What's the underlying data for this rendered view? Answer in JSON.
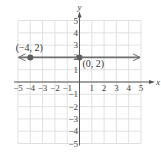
{
  "chart_data": {
    "type": "line",
    "title": "",
    "xlabel": "x",
    "ylabel": "y",
    "xlim": [
      -5,
      5
    ],
    "ylim": [
      -5,
      5
    ],
    "grid": true,
    "x_ticks": [
      -5,
      -4,
      -3,
      -2,
      -1,
      1,
      2,
      3,
      4,
      5
    ],
    "y_ticks": [
      5,
      4,
      3,
      2,
      1,
      -1,
      -2,
      -3,
      -4,
      -5
    ],
    "x_tick_labels": [
      "−5",
      "−4",
      "−3",
      "−2",
      "−1",
      "1",
      "2",
      "3",
      "4",
      "5"
    ],
    "y_tick_labels": [
      "5",
      "4",
      "3",
      "2",
      "1",
      "−1",
      "−2",
      "−3",
      "−4",
      "−5"
    ],
    "series": [
      {
        "name": "y = 2",
        "kind": "horizontal line with arrows at both ends",
        "y": 2,
        "points": [
          {
            "x": -4,
            "y": 2,
            "label": "(−4, 2)"
          },
          {
            "x": 0,
            "y": 2,
            "label": "(0, 2)"
          }
        ]
      }
    ],
    "colors": {
      "line": "#6f6f6f",
      "point": "#5e5e5e",
      "grid": "#d9d9d9",
      "axis": "#555555"
    }
  }
}
